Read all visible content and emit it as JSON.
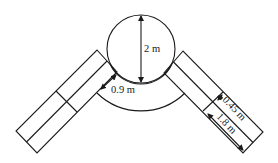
{
  "diagram": {
    "labels": {
      "drum_diameter": "2 m",
      "gap_distance": "0.9 m",
      "belt_half_width": "0.45 m",
      "belt_length_segment": "1.8 m"
    },
    "colors": {
      "line": "#1a1a1a",
      "background": "#ffffff"
    }
  }
}
